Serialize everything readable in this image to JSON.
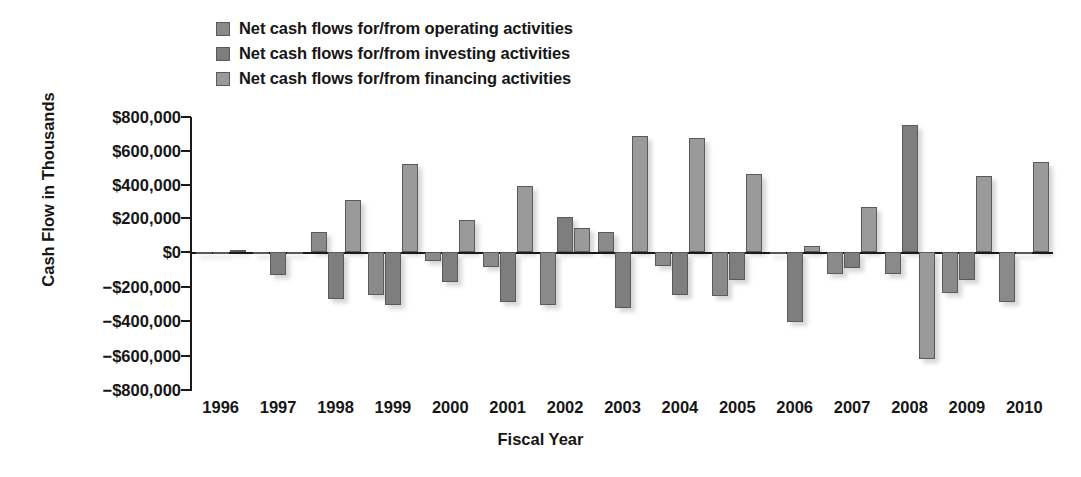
{
  "chart_data": {
    "type": "bar",
    "title": "",
    "subtitle": "",
    "xlabel": "Fiscal Year",
    "ylabel": "Cash Flow in Thousands",
    "ylim": [
      -800000,
      800000
    ],
    "ytick_labels": [
      "$800,000",
      "$600,000",
      "$400,000",
      "$200,000",
      "$0",
      "−$200,000",
      "−$400,000",
      "−$600,000",
      "−$800,000"
    ],
    "ytick_values": [
      800000,
      600000,
      400000,
      200000,
      0,
      -200000,
      -400000,
      -600000,
      -800000
    ],
    "grid": false,
    "legend_position": "top-left",
    "categories": [
      "1996",
      "1997",
      "1998",
      "1999",
      "2000",
      "2001",
      "2002",
      "2003",
      "2004",
      "2005",
      "2006",
      "2007",
      "2008",
      "2009",
      "2010"
    ],
    "series": [
      {
        "name": "Net cash flows for/from operating activities",
        "color": "#8a8a8a",
        "values": [
          -3000,
          -12000,
          120000,
          -250000,
          -55000,
          -85000,
          -310000,
          120000,
          -80000,
          -255000,
          -6000,
          -125000,
          -130000,
          -240000,
          -290000
        ]
      },
      {
        "name": "Net cash flows for/from investing activities",
        "color": "#7e7e7e",
        "values": [
          -2000,
          -135000,
          -270000,
          -310000,
          -175000,
          -290000,
          210000,
          -325000,
          -250000,
          -160000,
          -405000,
          -90000,
          750000,
          -160000,
          -10000
        ]
      },
      {
        "name": "Net cash flows for/from financing activities",
        "color": "#9a9a9a",
        "values": [
          2000,
          -2000,
          310000,
          520000,
          190000,
          390000,
          140000,
          690000,
          675000,
          465000,
          35000,
          265000,
          -620000,
          450000,
          535000
        ]
      }
    ]
  },
  "legend": {
    "items": [
      {
        "label": "Net cash flows for/from operating activities",
        "color": "#8a8a8a"
      },
      {
        "label": "Net cash flows for/from investing activities",
        "color": "#7e7e7e"
      },
      {
        "label": "Net cash flows for/from financing activities",
        "color": "#9a9a9a"
      }
    ]
  },
  "axes": {
    "y_title": "Cash Flow in Thousands",
    "x_title": "Fiscal Year"
  }
}
